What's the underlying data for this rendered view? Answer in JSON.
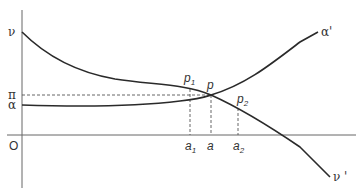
{
  "diagram": {
    "axes": {
      "origin_label": "O"
    },
    "y_labels": {
      "nu": "ν",
      "pi": "π",
      "alpha": "α"
    },
    "curves": {
      "nu_curve_end_label": "ν '",
      "alpha_curve_end_label": "α'"
    },
    "points": {
      "p1": {
        "base": "p",
        "sub": "1"
      },
      "p": {
        "base": "p"
      },
      "p2": {
        "base": "p",
        "sub": "2"
      }
    },
    "x_labels": {
      "a1": {
        "base": "a",
        "sub": "1"
      },
      "a": {
        "base": "a"
      },
      "a2": {
        "base": "a",
        "sub": "2"
      }
    },
    "colors": {
      "curve": "#2a2a2a",
      "axis": "#555555",
      "dashed": "#555555"
    }
  }
}
